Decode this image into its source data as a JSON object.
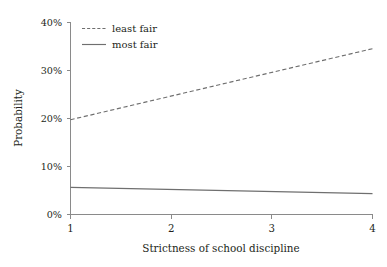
{
  "chart_data": {
    "type": "line",
    "title": "",
    "xlabel": "Strictness of school discipline",
    "ylabel": "Probability",
    "x": [
      1,
      4
    ],
    "xlim": [
      1,
      4
    ],
    "ylim": [
      0,
      40
    ],
    "grid": false,
    "legend_position": "top-left",
    "x_tick_labels": [
      "1",
      "2",
      "3",
      "4"
    ],
    "x_tick_values": [
      1,
      2,
      3,
      4
    ],
    "y_tick_labels": [
      "0%",
      "10%",
      "20%",
      "30%",
      "40%"
    ],
    "y_tick_values": [
      0,
      10,
      20,
      30,
      40
    ],
    "series": [
      {
        "name": "least fair",
        "style": "dashed",
        "color": "#6f6f6f",
        "x": [
          1,
          4
        ],
        "values": [
          19.7,
          34.5
        ]
      },
      {
        "name": "most fair",
        "style": "solid",
        "color": "#6f6f6f",
        "x": [
          1,
          4
        ],
        "values": [
          5.6,
          4.3
        ]
      }
    ]
  },
  "axes": {
    "y_title": "Probability",
    "x_title": "Strictness of school discipline",
    "y_ticks": [
      {
        "label": "40%",
        "value": 40
      },
      {
        "label": "30%",
        "value": 30
      },
      {
        "label": "20%",
        "value": 20
      },
      {
        "label": "10%",
        "value": 10
      },
      {
        "label": "0%",
        "value": 0
      }
    ],
    "x_ticks": [
      {
        "label": "1",
        "value": 1
      },
      {
        "label": "2",
        "value": 2
      },
      {
        "label": "3",
        "value": 3
      },
      {
        "label": "4",
        "value": 4
      }
    ]
  },
  "legend": {
    "entries": [
      {
        "label": "least fair",
        "style": "dashed"
      },
      {
        "label": "most fair",
        "style": "solid"
      }
    ]
  },
  "colors": {
    "line": "#6f6f6f",
    "axis": "#8a8a8a",
    "text": "#231f20",
    "background": "#ffffff"
  }
}
